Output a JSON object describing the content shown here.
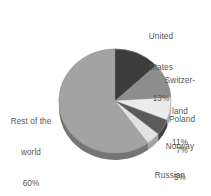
{
  "chart_data": {
    "type": "pie",
    "title": "",
    "subtitle": "",
    "xlabel": "",
    "ylabel": "",
    "legend_position": "callout-labels",
    "grid": false,
    "units": "percent",
    "start_angle_deg": 0,
    "direction": "clockwise",
    "categories": [
      "United States",
      "Switzerland",
      "Poland",
      "Norway",
      "Russian Federation",
      "Rest of the world"
    ],
    "values": [
      13,
      11,
      7,
      5,
      4,
      60
    ],
    "slices": [
      {
        "name": "United States",
        "value": 13,
        "label_lines": [
          "United",
          "States",
          "13%"
        ],
        "color": "#3c3c3c"
      },
      {
        "name": "Switzerland",
        "value": 11,
        "label_lines": [
          "Switzer-",
          "land",
          "11%"
        ],
        "color": "#8d8d8d"
      },
      {
        "name": "Poland",
        "value": 7,
        "label_lines": [
          "Poland",
          "7%"
        ],
        "color": "#ebebeb"
      },
      {
        "name": "Norway",
        "value": 5,
        "label_lines": [
          "Norway",
          "5%"
        ],
        "color": "#5b5b5b"
      },
      {
        "name": "Russian Federation",
        "value": 4,
        "label_lines": [
          "Russian",
          "Federation",
          "4%"
        ],
        "color": "#e2e2e2"
      },
      {
        "name": "Rest of the world",
        "value": 60,
        "label_lines": [
          "Rest of the",
          "world",
          "60%"
        ],
        "color": "#a3a3a3"
      }
    ],
    "style": {
      "background": "#ffffff",
      "label_color": "#565656",
      "three_d": true,
      "depth_px": 7,
      "rim_color": "#7a7a7a",
      "center_x": 115,
      "center_y": 101,
      "radius_x": 56,
      "radius_y": 52
    }
  },
  "labels": {
    "united_states": {
      "l1": "United",
      "l2": "States",
      "l3": "13%"
    },
    "switzerland": {
      "l1": "Switzer-",
      "l2": "land",
      "l3": "11%"
    },
    "poland": {
      "l1": "Poland",
      "l2": "7%"
    },
    "norway": {
      "l1": "Norway",
      "l2": "5%"
    },
    "russian_federation": {
      "l1": "Russian",
      "l2": "Federation",
      "l3": "4%"
    },
    "rest_of_world": {
      "l1": "Rest of the",
      "l2": "world",
      "l3": "60%"
    }
  }
}
